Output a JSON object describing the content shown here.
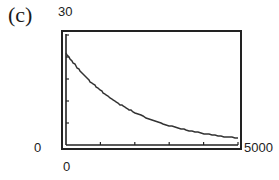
{
  "panel_label": "(c)",
  "axes": {
    "x_min_label": "0",
    "x_max_label": "5000",
    "y_min_label": "0",
    "y_max_label": "30"
  },
  "chart_data": {
    "type": "line",
    "title": "",
    "panel": "(c)",
    "xlabel": "",
    "ylabel": "",
    "xlim": [
      0,
      5000
    ],
    "ylim": [
      0,
      30
    ],
    "x_ticks": [
      0,
      1000,
      2000,
      3000,
      4000,
      5000
    ],
    "y_ticks": [
      0,
      6,
      12,
      18,
      24,
      30
    ],
    "grid": false,
    "legend": null,
    "style": "graphing-calculator screen, pixelated stepped curve, double-line frame",
    "series": [
      {
        "name": "f(x)",
        "description": "exponential decay, approx 25·e^(-0.00052x)",
        "x": [
          0,
          250,
          500,
          750,
          1000,
          1250,
          1500,
          1750,
          2000,
          2500,
          3000,
          3500,
          4000,
          4500,
          5000
        ],
        "y": [
          25,
          22.0,
          19.3,
          16.9,
          14.9,
          13.1,
          11.5,
          10.1,
          8.8,
          6.8,
          5.3,
          4.1,
          3.1,
          2.4,
          1.9
        ]
      }
    ]
  }
}
